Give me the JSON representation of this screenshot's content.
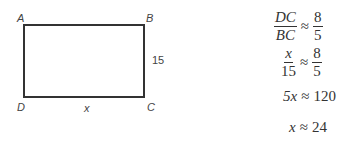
{
  "diagram": {
    "shape": "rectangle",
    "vertices": {
      "A": "A",
      "B": "B",
      "C": "C",
      "D": "D"
    },
    "side_bc_label": "15",
    "side_dc_label": "x"
  },
  "equations": [
    {
      "lhs_num": "DC",
      "lhs_den": "BC",
      "op": "≈",
      "rhs_num": "8",
      "rhs_den": "5"
    },
    {
      "lhs_num": "x",
      "lhs_den": "15",
      "op": "≈",
      "rhs_num": "8",
      "rhs_den": "5"
    },
    {
      "lhs": "5x",
      "op": "≈",
      "rhs": "120"
    },
    {
      "lhs": "x",
      "op": "≈",
      "rhs": "24"
    }
  ]
}
